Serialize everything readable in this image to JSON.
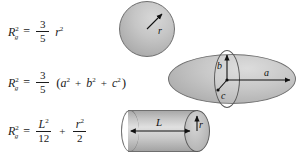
{
  "diagram": {
    "background": "#ffffff",
    "ink": "#1b1b1b",
    "shape_fill": "#c4c4c4",
    "shape_stroke": "#6f6f6f"
  },
  "symbols": {
    "R": "R",
    "sub_g": "g",
    "exp_2": "2",
    "equals": "=",
    "plus": "+",
    "paren_open": "(",
    "paren_close": ")"
  },
  "rows": [
    {
      "id": "sphere",
      "formula": {
        "lhs": "R",
        "lhs_sub": "g",
        "lhs_sup": "2",
        "fraction": {
          "num": "3",
          "den": "5"
        },
        "tail_var": "r",
        "tail_sup": "2"
      },
      "shape": {
        "name": "sphere",
        "labels": [
          {
            "text": "r",
            "meaning": "radius"
          }
        ]
      }
    },
    {
      "id": "ellipsoid",
      "formula": {
        "lhs": "R",
        "lhs_sub": "g",
        "lhs_sup": "2",
        "fraction": {
          "num": "3",
          "den": "5"
        },
        "group": [
          {
            "var": "a",
            "sup": "2"
          },
          {
            "var": "b",
            "sup": "2"
          },
          {
            "var": "c",
            "sup": "2"
          }
        ]
      },
      "shape": {
        "name": "ellipsoid",
        "labels": [
          {
            "text": "a",
            "meaning": "semi-axis-a"
          },
          {
            "text": "b",
            "meaning": "semi-axis-b"
          },
          {
            "text": "c",
            "meaning": "semi-axis-c"
          }
        ]
      }
    },
    {
      "id": "cylinder",
      "formula": {
        "lhs": "R",
        "lhs_sub": "g",
        "lhs_sup": "2",
        "term1": {
          "num_var": "L",
          "num_sup": "2",
          "den": "12"
        },
        "term2": {
          "num_var": "r",
          "num_sup": "2",
          "den": "2"
        }
      },
      "shape": {
        "name": "cylinder",
        "labels": [
          {
            "text": "L",
            "meaning": "length"
          },
          {
            "text": "r",
            "meaning": "radius"
          }
        ]
      }
    }
  ]
}
